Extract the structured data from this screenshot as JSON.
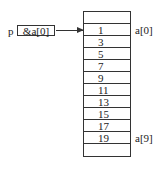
{
  "pointer": {
    "name": "p",
    "value": "&a[0]"
  },
  "array": {
    "cells": [
      "",
      "1",
      "3",
      "5",
      "7",
      "9",
      "11",
      "13",
      "15",
      "17",
      "19",
      ""
    ],
    "labels": {
      "first": "a[0]",
      "last": "a[9]"
    }
  }
}
